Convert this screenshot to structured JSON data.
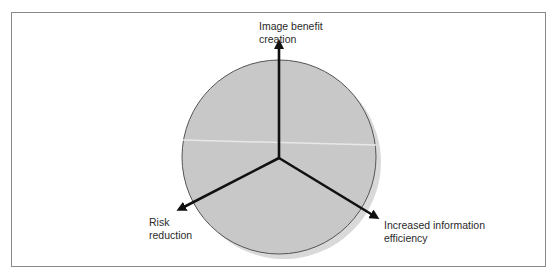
{
  "diagram": {
    "type": "radial-three-axis",
    "colors": {
      "circle_fill": "#c8c8c8",
      "circle_shadow": "#d9d9d9",
      "circle_stroke": "#555555",
      "axis": "#111111",
      "frame": "#8a8a8a",
      "text": "#2a2a2a"
    },
    "axes": [
      {
        "id": "top",
        "label": "Image benefit\ncreation"
      },
      {
        "id": "lower-left",
        "label": "Risk\nreduction"
      },
      {
        "id": "lower-right",
        "label": "Increased information\nefficiency"
      }
    ]
  }
}
